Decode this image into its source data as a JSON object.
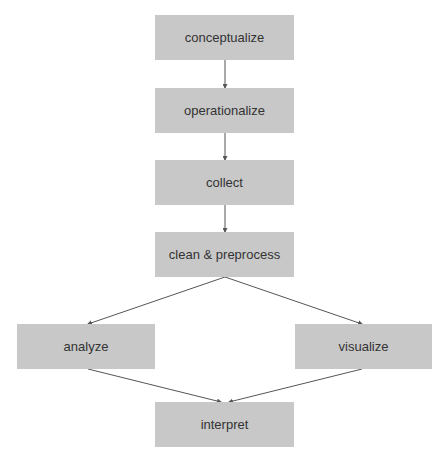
{
  "diagram": {
    "type": "flowchart",
    "node_color": "#c8c8c8",
    "text_color": "#333333",
    "edge_color": "#555555",
    "nodes": [
      {
        "id": "conceptualize",
        "label": "conceptualize"
      },
      {
        "id": "operationalize",
        "label": "operationalize"
      },
      {
        "id": "collect",
        "label": "collect"
      },
      {
        "id": "clean",
        "label": "clean & preprocess"
      },
      {
        "id": "analyze",
        "label": "analyze"
      },
      {
        "id": "visualize",
        "label": "visualize"
      },
      {
        "id": "interpret",
        "label": "interpret"
      }
    ],
    "edges": [
      {
        "from": "conceptualize",
        "to": "operationalize"
      },
      {
        "from": "operationalize",
        "to": "collect"
      },
      {
        "from": "collect",
        "to": "clean"
      },
      {
        "from": "clean",
        "to": "analyze"
      },
      {
        "from": "clean",
        "to": "visualize"
      },
      {
        "from": "analyze",
        "to": "interpret"
      },
      {
        "from": "visualize",
        "to": "interpret"
      }
    ]
  }
}
